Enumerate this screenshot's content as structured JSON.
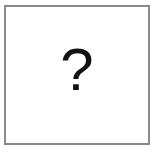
{
  "placeholder": {
    "symbol": "?",
    "icon": "question-mark-icon",
    "border_color": "#8a8a8a",
    "background_color": "#ffffff",
    "symbol_color": "#111111"
  }
}
